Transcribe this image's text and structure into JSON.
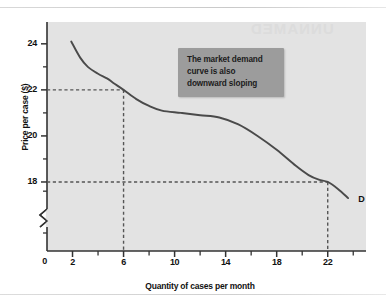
{
  "figure": {
    "watermark_text": "UNNAMED",
    "curve_label": "D",
    "callout": {
      "lines": [
        "The market demand",
        "curve is also",
        "downward sloping"
      ],
      "bg_color": "#9c9c9c",
      "text_color": "#1b1b1b"
    },
    "colors": {
      "page_background": "#ffffff",
      "plot_background": "#e3e3e3",
      "axis": "#333333",
      "curve": "#4a4a4a",
      "guide_dashes": "#555555"
    }
  },
  "chart_data": {
    "type": "line",
    "title": "",
    "xlabel": "Quantity of cases per month",
    "ylabel": "Price per case ($)",
    "xlim": [
      0,
      25
    ],
    "ylim": [
      17,
      24.6
    ],
    "grid": false,
    "legend": "none",
    "y_axis_break": true,
    "y_axis_break_note": "Axis broken between 0 and about 17.4",
    "x_ticks_major": [
      2,
      6,
      10,
      14,
      18,
      22
    ],
    "x_ticks_minor": [
      4,
      8,
      12,
      16,
      20,
      24
    ],
    "x_origin_label": "0",
    "y_ticks_major": [
      24,
      22,
      20,
      18
    ],
    "y_ticks_minor": [
      23,
      21,
      19
    ],
    "series": [
      {
        "name": "D",
        "label": "D",
        "points": [
          [
            1.9,
            24.1
          ],
          [
            2.6,
            23.4
          ],
          [
            3.2,
            23.0
          ],
          [
            4.0,
            22.7
          ],
          [
            4.7,
            22.5
          ],
          [
            5.2,
            22.3
          ],
          [
            6.0,
            22.0
          ],
          [
            7.0,
            21.6
          ],
          [
            8.0,
            21.3
          ],
          [
            9.0,
            21.1
          ],
          [
            10.5,
            21.0
          ],
          [
            12.0,
            20.9
          ],
          [
            13.5,
            20.8
          ],
          [
            15.0,
            20.5
          ],
          [
            16.5,
            20.0
          ],
          [
            18.0,
            19.4
          ],
          [
            19.5,
            18.7
          ],
          [
            20.5,
            18.3
          ],
          [
            21.3,
            18.1
          ],
          [
            22.0,
            18.0
          ],
          [
            22.8,
            17.7
          ],
          [
            23.6,
            17.3
          ]
        ]
      }
    ],
    "annotations": [
      {
        "kind": "guide",
        "x": 6,
        "y": 22,
        "style": "dashed",
        "note": "Price 22 at quantity 6"
      },
      {
        "kind": "guide",
        "x": 22,
        "y": 18,
        "style": "dashed",
        "note": "Price 18 at quantity 22"
      }
    ]
  }
}
